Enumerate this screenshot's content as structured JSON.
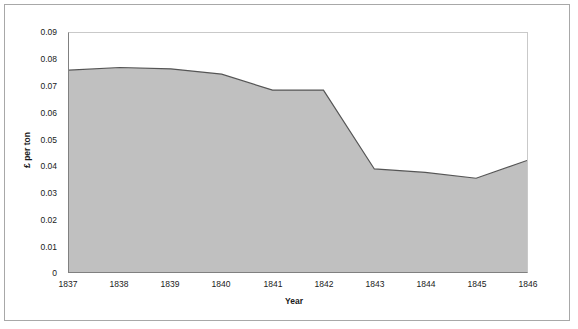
{
  "chart_data": {
    "type": "area",
    "title": "",
    "xlabel": "Year",
    "ylabel": "£ per ton",
    "x": [
      1837,
      1838,
      1839,
      1840,
      1841,
      1842,
      1843,
      1844,
      1845,
      1846
    ],
    "categories": [
      "1837",
      "1838",
      "1839",
      "1840",
      "1841",
      "1842",
      "1843",
      "1844",
      "1845",
      "1846"
    ],
    "values": [
      0.076,
      0.077,
      0.0765,
      0.0745,
      0.0685,
      0.0685,
      0.0388,
      0.0375,
      0.0353,
      0.042
    ],
    "series": [
      {
        "name": "£ per ton",
        "values": [
          0.076,
          0.077,
          0.0765,
          0.0745,
          0.0685,
          0.0685,
          0.0388,
          0.0375,
          0.0353,
          0.042
        ]
      }
    ],
    "ylim": [
      0,
      0.09
    ],
    "xlim": [
      1837,
      1846
    ],
    "yticks": [
      0,
      0.01,
      0.02,
      0.03,
      0.04,
      0.05,
      0.06,
      0.07,
      0.08,
      0.09
    ],
    "ytick_labels": [
      "0",
      "0.01",
      "0.02",
      "0.03",
      "0.04",
      "0.05",
      "0.06",
      "0.07",
      "0.08",
      "0.09"
    ],
    "xtick_labels": [
      "1837",
      "1838",
      "1839",
      "1840",
      "1841",
      "1842",
      "1843",
      "1844",
      "1845",
      "1846"
    ],
    "grid": false,
    "legend": false,
    "legend_position": "none",
    "colors": {
      "area_fill": "#c0c0c0",
      "area_line": "#555555",
      "axis": "#808080",
      "frame": "#a8a8a8",
      "text": "#1a1a1a",
      "plot_background": "#ffffff"
    }
  }
}
